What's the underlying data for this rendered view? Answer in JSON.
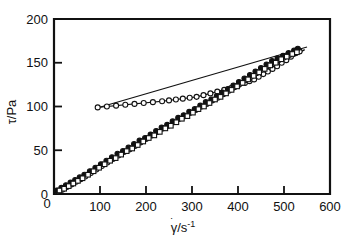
{
  "figure": {
    "title": "",
    "background_color": "#ffffff",
    "foreground_color": "#111111"
  },
  "axes": {
    "x": {
      "label_main": "γ",
      "label_dot": "˙",
      "label_rest": "/s",
      "label_exponent": "-1",
      "label_full": "γ̇/s⁻¹",
      "ticks": [
        "0",
        "100",
        "200",
        "300",
        "400",
        "500",
        "600"
      ],
      "tick_values": [
        0,
        100,
        200,
        300,
        400,
        500,
        600
      ],
      "min": 0,
      "max": 600
    },
    "y": {
      "label_main": "τ",
      "label_rest": "/Pa",
      "label_full": "τ/Pa",
      "ticks": [
        "0",
        "50",
        "100",
        "150",
        "200"
      ],
      "tick_values": [
        0,
        50,
        100,
        150,
        200
      ],
      "min": 0,
      "max": 200
    }
  },
  "chart_data": {
    "type": "scatter",
    "title": "",
    "xlabel": "γ̇/s⁻¹",
    "ylabel": "τ/Pa",
    "xlim": [
      0,
      600
    ],
    "ylim": [
      0,
      200
    ],
    "xticks": [
      0,
      100,
      200,
      300,
      400,
      500,
      600
    ],
    "yticks": [
      0,
      50,
      100,
      150,
      200
    ],
    "grid": false,
    "legend": "none",
    "series": [
      {
        "name": "upper-branch-open-circles",
        "marker": "open-circle",
        "marker_fill": "#ffffff",
        "marker_stroke": "#111111",
        "line": true,
        "x": [
          95,
          115,
          135,
          155,
          175,
          195,
          215,
          235,
          250,
          265,
          280,
          295,
          310,
          325,
          340,
          355,
          370,
          385,
          400,
          415,
          425,
          435,
          445,
          455,
          465,
          475,
          485,
          495,
          505,
          515,
          525,
          532
        ],
        "y": [
          99,
          100,
          101,
          102,
          103,
          104,
          105,
          106,
          107,
          108,
          109,
          110,
          111,
          113,
          115,
          117,
          119,
          121,
          124,
          127,
          129,
          131,
          134,
          137,
          140,
          143,
          146,
          150,
          153,
          157,
          161,
          164
        ]
      },
      {
        "name": "lower-branch-open-circles",
        "marker": "open-circle",
        "marker_fill": "#ffffff",
        "marker_stroke": "#111111",
        "line": false,
        "x": [
          8,
          18,
          28,
          38,
          48,
          58,
          68,
          80,
          92,
          104,
          116,
          128,
          140,
          152,
          164,
          176,
          188,
          200,
          212,
          224,
          236,
          248,
          260,
          272,
          284,
          296,
          308,
          320,
          332,
          344,
          356,
          368,
          380,
          392,
          404,
          416,
          428,
          440,
          452,
          464,
          476,
          488,
          500,
          512,
          524,
          534
        ],
        "y": [
          3,
          5,
          8,
          11,
          14,
          17,
          20,
          24,
          28,
          32,
          36,
          40,
          44,
          48,
          51,
          55,
          59,
          63,
          67,
          71,
          75,
          78,
          82,
          86,
          89,
          93,
          96,
          100,
          103,
          107,
          110,
          114,
          118,
          122,
          126,
          130,
          134,
          138,
          142,
          146,
          150,
          153,
          156,
          159,
          161,
          163
        ]
      },
      {
        "name": "lower-branch-filled-circles",
        "marker": "filled-circle",
        "marker_fill": "#111111",
        "marker_stroke": "#111111",
        "line": false,
        "x": [
          6,
          16,
          26,
          36,
          46,
          56,
          66,
          78,
          90,
          102,
          114,
          126,
          138,
          150,
          162,
          174,
          186,
          198,
          210,
          222,
          234,
          246,
          258,
          270,
          282,
          294,
          306,
          318,
          330,
          342,
          354,
          366,
          378,
          390,
          402,
          414,
          426,
          438,
          450,
          462,
          474,
          486,
          498,
          510,
          522,
          530
        ],
        "y": [
          4,
          7,
          10,
          13,
          16,
          19,
          22,
          26,
          30,
          34,
          38,
          42,
          46,
          49,
          53,
          57,
          61,
          64,
          68,
          72,
          76,
          79,
          83,
          87,
          90,
          94,
          97,
          101,
          105,
          108,
          112,
          116,
          120,
          124,
          128,
          132,
          136,
          140,
          144,
          148,
          152,
          155,
          158,
          161,
          164,
          166
        ]
      },
      {
        "name": "lower-branch-open-squares",
        "marker": "open-square",
        "marker_fill": "#ffffff",
        "marker_stroke": "#111111",
        "line": false,
        "x": [
          12,
          22,
          32,
          42,
          52,
          62,
          74,
          86,
          98,
          110,
          122,
          134,
          146,
          158,
          170,
          182,
          194,
          206,
          218,
          230,
          242,
          254,
          266,
          278,
          290,
          302,
          314,
          326,
          338,
          350,
          362,
          374,
          386,
          398,
          410,
          422,
          434,
          446,
          458,
          470,
          482,
          494,
          506,
          518,
          528
        ],
        "y": [
          4,
          6,
          9,
          12,
          15,
          18,
          22,
          26,
          30,
          34,
          38,
          41,
          45,
          49,
          52,
          56,
          60,
          64,
          67,
          71,
          75,
          78,
          82,
          86,
          89,
          93,
          97,
          100,
          104,
          108,
          111,
          115,
          119,
          123,
          127,
          131,
          135,
          139,
          143,
          147,
          150,
          154,
          157,
          160,
          162
        ]
      }
    ],
    "fit_lines": [
      {
        "name": "upper-branch-fit",
        "x0": 92,
        "y0": 98,
        "x1": 550,
        "y1": 168
      },
      {
        "name": "lower-branch-fit",
        "x0": 0,
        "y0": 2,
        "x1": 545,
        "y1": 165
      }
    ]
  }
}
